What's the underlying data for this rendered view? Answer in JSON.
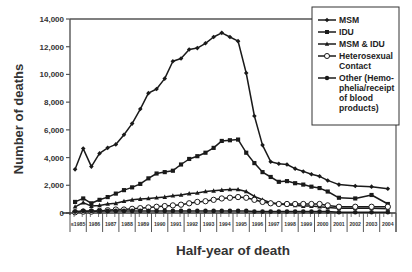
{
  "chart_data": {
    "type": "line",
    "title": "",
    "xlabel": "Half-year of death",
    "ylabel": "Number of deaths",
    "ylim": [
      0,
      14000
    ],
    "yticks": [
      0,
      2000,
      4000,
      6000,
      8000,
      10000,
      12000,
      14000
    ],
    "ytick_labels": [
      "0",
      "2,000",
      "4,000",
      "6,000",
      "8,000",
      "10,000",
      "12,000",
      "14,000"
    ],
    "x_tick_labels": [
      "≤1985",
      "1986",
      "1987",
      "1988",
      "1989",
      "1990",
      "1991",
      "1992",
      "1993",
      "1994",
      "1995",
      "1996",
      "1997",
      "1998",
      "1999",
      "2000",
      "2001",
      "2002",
      "2003",
      "2004"
    ],
    "grid": false,
    "legend_position": "upper right",
    "x": [
      "≤1985a",
      "≤1985b",
      "1986a",
      "1986b",
      "1987a",
      "1987b",
      "1988a",
      "1988b",
      "1989a",
      "1989b",
      "1990a",
      "1990b",
      "1991a",
      "1991b",
      "1992a",
      "1992b",
      "1993a",
      "1993b",
      "1994a",
      "1994b",
      "1995a",
      "1995b",
      "1996a",
      "1996b",
      "1997a",
      "1997b",
      "1998a",
      "1998b",
      "1999a",
      "1999b",
      "2000a",
      "2000b",
      "2001",
      "2002",
      "2003",
      "2004"
    ],
    "series": [
      {
        "name": "MSM",
        "marker": "diamond",
        "values": [
          3150,
          4650,
          3350,
          4300,
          4700,
          4950,
          5650,
          6450,
          7500,
          8650,
          8950,
          9700,
          10950,
          11150,
          11800,
          11900,
          12250,
          12700,
          13000,
          12700,
          12400,
          10100,
          7000,
          4900,
          3700,
          3550,
          3500,
          3200,
          3000,
          2800,
          2650,
          2350,
          2050,
          1950,
          1900,
          1750
        ]
      },
      {
        "name": "IDU",
        "marker": "square",
        "values": [
          800,
          1050,
          700,
          950,
          1150,
          1400,
          1650,
          1850,
          2100,
          2500,
          2850,
          2950,
          3050,
          3500,
          3900,
          4100,
          4350,
          4700,
          5200,
          5250,
          5300,
          4350,
          3600,
          2950,
          2600,
          2250,
          2300,
          2150,
          2050,
          1900,
          1800,
          1550,
          1100,
          1050,
          1300,
          650
        ]
      },
      {
        "name": "MSM & IDU",
        "marker": "triangle",
        "values": [
          450,
          750,
          500,
          550,
          650,
          700,
          850,
          950,
          1000,
          1050,
          1100,
          1150,
          1250,
          1300,
          1400,
          1450,
          1550,
          1600,
          1650,
          1700,
          1700,
          1550,
          1200,
          950,
          750,
          650,
          600,
          550,
          500,
          500,
          450,
          400,
          350,
          350,
          350,
          300
        ]
      },
      {
        "name": "Heterosexual Contact",
        "marker": "open-circle",
        "values": [
          50,
          100,
          100,
          150,
          200,
          250,
          250,
          300,
          350,
          400,
          450,
          500,
          550,
          600,
          700,
          800,
          850,
          950,
          1050,
          1100,
          1150,
          1100,
          950,
          800,
          700,
          650,
          650,
          650,
          650,
          650,
          650,
          550,
          450,
          450,
          450,
          450
        ]
      },
      {
        "name": "Other (Hemophelia/receipt of blood products)",
        "marker": "filled-circle",
        "values": [
          100,
          150,
          150,
          150,
          150,
          150,
          150,
          150,
          150,
          150,
          150,
          150,
          150,
          150,
          150,
          150,
          150,
          150,
          150,
          150,
          150,
          150,
          100,
          100,
          100,
          100,
          100,
          100,
          100,
          100,
          100,
          100,
          50,
          50,
          50,
          50
        ]
      }
    ]
  },
  "legend": {
    "items": [
      {
        "lines": [
          "MSM"
        ],
        "marker": "diamond"
      },
      {
        "lines": [
          "IDU"
        ],
        "marker": "square"
      },
      {
        "lines": [
          "MSM & IDU"
        ],
        "marker": "triangle"
      },
      {
        "lines": [
          "Heterosexual",
          "Contact"
        ],
        "marker": "open-circle"
      },
      {
        "lines": [
          "Other (Hemo-",
          "phelia/receipt",
          "of blood",
          "products)"
        ],
        "marker": "filled-circle"
      }
    ]
  },
  "colors": {
    "line": "#1a1a1a",
    "text": "#333333",
    "axis": "#555555"
  }
}
